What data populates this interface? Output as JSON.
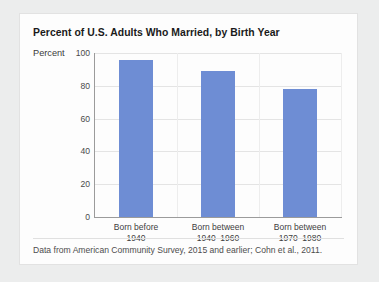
{
  "colors": {
    "bar": "#6e8dd4",
    "page_background": "#eceded",
    "card_background": "#fdfdfd",
    "axis": "#9b9b9b",
    "gridline": "#e4e4e4"
  },
  "chart_data": {
    "type": "bar",
    "title": "Percent of U.S. Adults Who Married, by Birth Year",
    "xlabel": "",
    "ylabel": "Percent",
    "ylim": [
      0,
      100
    ],
    "yticks": [
      0,
      20,
      40,
      60,
      80,
      100
    ],
    "grid": true,
    "legend": "none",
    "categories": [
      "Born before\n1940",
      "Born between\n1940–1960",
      "Born between\n1970–1980"
    ],
    "category_lines": [
      [
        "Born before",
        "1940"
      ],
      [
        "Born between",
        "1940–1960"
      ],
      [
        "Born between",
        "1970–1980"
      ]
    ],
    "values": [
      96,
      89,
      78
    ],
    "bar_color": "#6e8dd4",
    "footnote": "Data from American Community Survey, 2015 and earlier; Cohn et al., 2011."
  }
}
